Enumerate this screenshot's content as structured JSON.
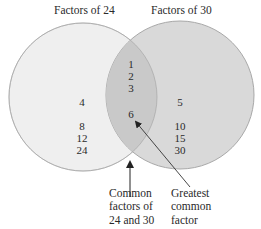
{
  "diagram": {
    "type": "venn",
    "sets": [
      {
        "label": "Factors of 24",
        "only_values": [
          "4",
          "8",
          "12",
          "24"
        ],
        "fill": "#efefef",
        "stroke": "#bdbdbd"
      },
      {
        "label": "Factors of 30",
        "only_values": [
          "5",
          "10",
          "15",
          "30"
        ],
        "fill": "#d9d9d9",
        "stroke": "#a8a8a8"
      }
    ],
    "intersection": {
      "values": [
        "1",
        "2",
        "3",
        "6"
      ],
      "fill": "#c9c9c9"
    },
    "annotations": [
      {
        "text_lines": [
          "Common",
          "factors of",
          "24 and 30"
        ],
        "points_to": "intersection"
      },
      {
        "text_lines": [
          "Greatest",
          "common",
          "factor"
        ],
        "points_to": "6"
      }
    ]
  }
}
